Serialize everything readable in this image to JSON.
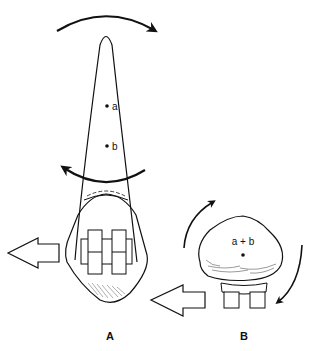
{
  "figure": {
    "panel_a": {
      "label": "A",
      "point_a": "a",
      "point_b": "b",
      "description": "Incisor viewed laterally with bracket; rotational arrows about crown and root, force arrow to the left"
    },
    "panel_b": {
      "label": "B",
      "center_label": "a + b",
      "description": "Tooth viewed occlusally with bracket; rotation arrows around centre, force arrow to the left"
    },
    "colors": {
      "stroke": "#111111",
      "background": "#ffffff"
    }
  }
}
